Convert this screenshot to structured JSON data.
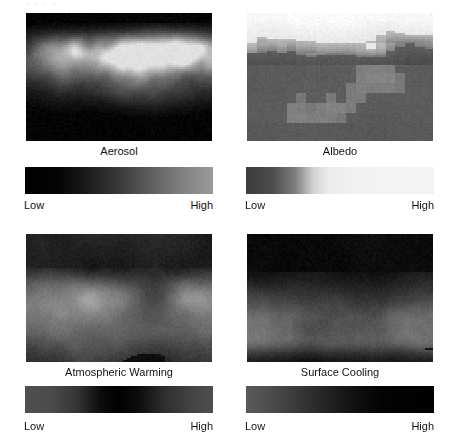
{
  "figure": {
    "background_color": "#ffffff",
    "header_remnant": "·   ·      ·        ·",
    "scale_low_label": "Low",
    "scale_high_label": "High"
  },
  "panels": [
    {
      "id": "aerosol",
      "label": "Aerosol",
      "position": {
        "x": 26,
        "y": 13,
        "width": 186,
        "height": 128
      },
      "label_y": 145,
      "colorbar": {
        "x": 25,
        "y": 167,
        "width": 188,
        "height": 27,
        "direction": "left-to-right",
        "stops": [
          {
            "pos": 0,
            "color": "#000000"
          },
          {
            "pos": 18,
            "color": "#050505"
          },
          {
            "pos": 34,
            "color": "#1d1d1d"
          },
          {
            "pos": 50,
            "color": "#3a3a3a"
          },
          {
            "pos": 66,
            "color": "#5c5c5c"
          },
          {
            "pos": 82,
            "color": "#7e7e7e"
          },
          {
            "pos": 100,
            "color": "#9a9a9a"
          }
        ],
        "low_label": "Low",
        "high_label": "High",
        "scale_y": 198
      },
      "map_style": {
        "type": "aerosol-dark",
        "base": "#050505",
        "bright": "#d8d8d8",
        "description": "dark global map with bright aerosol plumes across mid-latitudes"
      }
    },
    {
      "id": "albedo",
      "label": "Albedo",
      "position": {
        "x": 247,
        "y": 13,
        "width": 186,
        "height": 128
      },
      "label_y": 145,
      "colorbar": {
        "x": 246,
        "y": 167,
        "width": 188,
        "height": 27,
        "direction": "left-to-right",
        "stops": [
          {
            "pos": 0,
            "color": "#3c3c3c"
          },
          {
            "pos": 14,
            "color": "#4c4c4c"
          },
          {
            "pos": 26,
            "color": "#7d7d7d"
          },
          {
            "pos": 36,
            "color": "#d3d3d3"
          },
          {
            "pos": 44,
            "color": "#ececec"
          },
          {
            "pos": 60,
            "color": "#f2f2f2"
          },
          {
            "pos": 100,
            "color": "#f4f4f4"
          }
        ],
        "low_label": "Low",
        "high_label": "High",
        "scale_y": 198
      },
      "map_style": {
        "type": "albedo-blocky",
        "base": "#5a5a5a",
        "bright": "#e8e8e8",
        "description": "coarse blocky grid, bright high-albedo band across the north, dark mid/low latitudes"
      }
    },
    {
      "id": "atmospheric-warming",
      "label": "Atmospheric Warming",
      "position": {
        "x": 26,
        "y": 234,
        "width": 186,
        "height": 128
      },
      "label_y": 366,
      "colorbar": {
        "x": 25,
        "y": 386,
        "width": 188,
        "height": 27,
        "direction": "left-to-right",
        "stops": [
          {
            "pos": 0,
            "color": "#515151"
          },
          {
            "pos": 14,
            "color": "#4a4a4a"
          },
          {
            "pos": 28,
            "color": "#343434"
          },
          {
            "pos": 40,
            "color": "#0d0d0d"
          },
          {
            "pos": 50,
            "color": "#000000"
          },
          {
            "pos": 60,
            "color": "#0c0c0c"
          },
          {
            "pos": 74,
            "color": "#2e2e2e"
          },
          {
            "pos": 88,
            "color": "#434343"
          },
          {
            "pos": 100,
            "color": "#4d4d4d"
          }
        ],
        "low_label": "Low",
        "high_label": "High",
        "scale_y": 419
      },
      "map_style": {
        "type": "warming-mottled",
        "base": "#202020",
        "bright": "#8e8e8e",
        "description": "dark northern region with mottled mid grey continents and grey southern band"
      }
    },
    {
      "id": "surface-cooling",
      "label": "Surface Cooling",
      "position": {
        "x": 247,
        "y": 234,
        "width": 186,
        "height": 128
      },
      "label_y": 366,
      "colorbar": {
        "x": 246,
        "y": 386,
        "width": 188,
        "height": 27,
        "direction": "left-to-right",
        "stops": [
          {
            "pos": 0,
            "color": "#5a5a5a"
          },
          {
            "pos": 12,
            "color": "#4e4e4e"
          },
          {
            "pos": 26,
            "color": "#3b3b3b"
          },
          {
            "pos": 42,
            "color": "#242424"
          },
          {
            "pos": 58,
            "color": "#101010"
          },
          {
            "pos": 72,
            "color": "#040404"
          },
          {
            "pos": 100,
            "color": "#000000"
          }
        ],
        "low_label": "Low",
        "high_label": "High",
        "scale_y": 419
      },
      "map_style": {
        "type": "cooling-mottled",
        "base": "#1a1a1a",
        "bright": "#7c7c7c",
        "description": "very dark north, broad mid-grey band over continents, dark patches in far south"
      }
    }
  ]
}
